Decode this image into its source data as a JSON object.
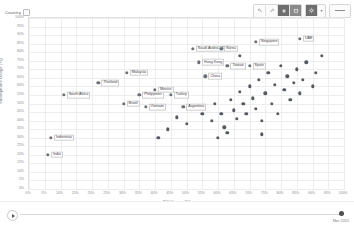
{
  "header": {
    "field_pill_label": "Country",
    "sort_icon": "sort-icon"
  },
  "toolbar": {
    "buttons": [
      {
        "name": "undo-button",
        "icon": "undo-icon"
      },
      {
        "name": "redo-button",
        "icon": "redo-icon"
      },
      {
        "name": "pause-button",
        "icon": "pause-icon"
      },
      {
        "name": "presentation-button",
        "icon": "presentation-icon"
      }
    ],
    "settings_label": "gear-icon",
    "settings_caret": "▾",
    "share_label": "share-icon"
  },
  "chart_data": {
    "type": "scatter",
    "title": "",
    "xlabel": "PC Usage (%)",
    "ylabel": "Smartphone Usage (%)",
    "xlim": [
      0,
      100
    ],
    "ylim": [
      0,
      100
    ],
    "xtick_step": 5,
    "ytick_step": 5,
    "grid": true,
    "legend": "none",
    "xticks": [
      "0%",
      "5%",
      "10%",
      "15%",
      "20%",
      "25%",
      "30%",
      "35%",
      "40%",
      "45%",
      "50%",
      "55%",
      "60%",
      "65%",
      "70%",
      "75%",
      "80%",
      "85%",
      "90%",
      "95%",
      "100%"
    ],
    "yticks": [
      "0%",
      "5%",
      "10%",
      "15%",
      "20%",
      "25%",
      "30%",
      "35%",
      "40%",
      "45%",
      "50%",
      "55%",
      "60%",
      "65%",
      "70%",
      "75%",
      "80%",
      "85%",
      "90%",
      "95%",
      "100%"
    ],
    "points": [
      {
        "label": "India",
        "x": 6,
        "y": 20
      },
      {
        "label": "Indonesia",
        "x": 7,
        "y": 30
      },
      {
        "label": "South Africa",
        "x": 11,
        "y": 55
      },
      {
        "label": "Thailand",
        "x": 22,
        "y": 62
      },
      {
        "label": "Malaysia",
        "x": 31,
        "y": 68
      },
      {
        "label": "Brazil",
        "x": 30,
        "y": 50
      },
      {
        "label": "Philippines",
        "x": 35,
        "y": 55
      },
      {
        "label": "Vietnam",
        "x": 37,
        "y": 48
      },
      {
        "label": "Mexico",
        "x": 40,
        "y": 58
      },
      {
        "label": "Turkey",
        "x": 45,
        "y": 55
      },
      {
        "label": "Argentina",
        "x": 49,
        "y": 48
      },
      {
        "label": "China",
        "x": 56,
        "y": 66
      },
      {
        "label": "Hong Kong",
        "x": 54,
        "y": 74
      },
      {
        "label": "Saudi Arabia / KSA",
        "x": 52,
        "y": 82
      },
      {
        "label": "Korea",
        "x": 61,
        "y": 82
      },
      {
        "label": "Taiwan",
        "x": 63,
        "y": 72
      },
      {
        "label": "Spain",
        "x": 70,
        "y": 72
      },
      {
        "label": "Singapore",
        "x": 72,
        "y": 86
      },
      {
        "label": "UAE",
        "x": 86,
        "y": 88
      },
      {
        "label": "",
        "x": 55,
        "y": 44
      },
      {
        "label": "",
        "x": 58,
        "y": 40
      },
      {
        "label": "",
        "x": 59,
        "y": 50
      },
      {
        "label": "",
        "x": 61,
        "y": 44
      },
      {
        "label": "",
        "x": 62,
        "y": 36
      },
      {
        "label": "",
        "x": 63,
        "y": 33
      },
      {
        "label": "",
        "x": 64,
        "y": 52
      },
      {
        "label": "",
        "x": 65,
        "y": 46
      },
      {
        "label": "",
        "x": 66,
        "y": 41
      },
      {
        "label": "",
        "x": 67,
        "y": 57
      },
      {
        "label": "",
        "x": 68,
        "y": 50
      },
      {
        "label": "",
        "x": 69,
        "y": 44
      },
      {
        "label": "",
        "x": 70,
        "y": 60
      },
      {
        "label": "",
        "x": 71,
        "y": 53
      },
      {
        "label": "",
        "x": 72,
        "y": 47
      },
      {
        "label": "",
        "x": 73,
        "y": 64
      },
      {
        "label": "",
        "x": 74,
        "y": 40
      },
      {
        "label": "",
        "x": 75,
        "y": 56
      },
      {
        "label": "",
        "x": 76,
        "y": 68
      },
      {
        "label": "",
        "x": 77,
        "y": 50
      },
      {
        "label": "",
        "x": 78,
        "y": 61
      },
      {
        "label": "",
        "x": 79,
        "y": 44
      },
      {
        "label": "",
        "x": 80,
        "y": 72
      },
      {
        "label": "",
        "x": 81,
        "y": 58
      },
      {
        "label": "",
        "x": 82,
        "y": 66
      },
      {
        "label": "",
        "x": 83,
        "y": 52
      },
      {
        "label": "",
        "x": 84,
        "y": 62
      },
      {
        "label": "",
        "x": 85,
        "y": 70
      },
      {
        "label": "",
        "x": 86,
        "y": 56
      },
      {
        "label": "",
        "x": 87,
        "y": 64
      },
      {
        "label": "",
        "x": 88,
        "y": 74
      },
      {
        "label": "",
        "x": 90,
        "y": 60
      },
      {
        "label": "",
        "x": 91,
        "y": 68
      },
      {
        "label": "",
        "x": 93,
        "y": 78
      },
      {
        "label": "",
        "x": 50,
        "y": 38
      },
      {
        "label": "",
        "x": 47,
        "y": 42
      },
      {
        "label": "",
        "x": 44,
        "y": 35
      },
      {
        "label": "",
        "x": 41,
        "y": 30
      },
      {
        "label": "",
        "x": 60,
        "y": 30
      },
      {
        "label": "",
        "x": 74,
        "y": 32
      },
      {
        "label": "",
        "x": 67,
        "y": 78
      }
    ]
  },
  "timeline": {
    "play_icon": "play-icon",
    "current_label": "Mar 2015"
  }
}
